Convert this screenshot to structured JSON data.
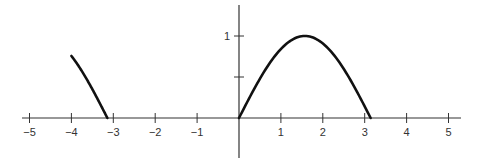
{
  "chart_data": {
    "type": "line",
    "title": "",
    "xlabel": "",
    "ylabel": "",
    "xlim": [
      -5.2,
      5.2
    ],
    "ylim": [
      -0.48,
      1.38
    ],
    "grid": false,
    "legend": null,
    "x_ticks": [
      -5,
      -4,
      -3,
      -2,
      -1,
      1,
      2,
      3,
      4,
      5
    ],
    "x_tick_labels": [
      "−5",
      "−4",
      "−3",
      "−2",
      "−1",
      "1",
      "2",
      "3",
      "4",
      "5"
    ],
    "y_ticks": [
      0.5,
      1
    ],
    "y_tick_labels": [
      "",
      "1"
    ],
    "series": [
      {
        "name": "sin(x) on [-4, -π]",
        "function": "sin(x)",
        "x_range": [
          -4,
          -3.1416
        ],
        "x": [
          -4,
          -3.8,
          -3.6,
          -3.4,
          -3.1416
        ],
        "values": [
          0.757,
          0.612,
          0.443,
          0.256,
          0
        ]
      },
      {
        "name": "sin(x) on [0, π]",
        "function": "sin(x)",
        "x_range": [
          0,
          3.1416
        ],
        "x": [
          0,
          0.5,
          1,
          1.5708,
          2,
          2.5,
          3,
          3.1416
        ],
        "values": [
          0,
          0.479,
          0.841,
          1,
          0.909,
          0.598,
          0.141,
          0
        ]
      }
    ],
    "colors": {
      "curve": "#111111",
      "axis": "#222222"
    }
  }
}
